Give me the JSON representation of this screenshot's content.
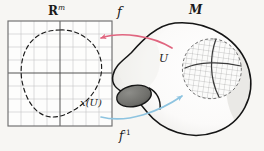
{
  "figure": {
    "type": "manifold-chart-diagram",
    "background_color": "#f7f6f3",
    "caption_labels": {
      "euclidean_space": "R",
      "euclidean_space_exponent": "m",
      "manifold": "M",
      "chart_map": "f",
      "inverse_chart_map": "f",
      "inverse_chart_map_exponent": "-1",
      "neighborhood": "U",
      "chart_image": "x(U)"
    }
  },
  "grid_panel": {
    "name": "euclidean-chart-panel",
    "label": "R",
    "exponent": "m",
    "x": 8,
    "y": 21,
    "width": 104,
    "height": 105,
    "cell_size": 13,
    "columns": 8,
    "rows": 8,
    "grid_line_color": "#bdbdbd",
    "axis_line_color": "#4a4a4a",
    "border_color": "#6e6e6e",
    "axis_x_at_row": 4,
    "axis_y_at_col": 4,
    "region_label": "x(U)",
    "region_outline_style": "dashed",
    "region_outline_color": "#1a1a1a"
  },
  "manifold": {
    "name": "manifold-surface",
    "label": "M",
    "outline_color": "#1a1a1a",
    "fill_color": "#fbfafa",
    "shade_color": "#ededeb",
    "hole": {
      "name": "manifold-hole",
      "fill_color": "#6f6f6c",
      "outline_color": "#161616"
    },
    "patch": {
      "name": "neighborhood-patch-U",
      "label": "U",
      "outline_style": "dashed",
      "outline_color": "#6b6b6b",
      "mesh_color": "#9a9a9a",
      "axis_color": "#3a3a3a"
    }
  },
  "arrows": {
    "forward": {
      "name": "arrow-f",
      "label": "f",
      "color": "#e0657f",
      "direction": "right-to-left",
      "from": [
        172,
        48
      ],
      "to": [
        99,
        38
      ]
    },
    "inverse": {
      "name": "arrow-f-inverse",
      "label": "f",
      "label_exponent": "-1",
      "color": "#8ec4e0",
      "direction": "left-to-right",
      "from": [
        101,
        117
      ],
      "to": [
        184,
        95
      ]
    }
  }
}
